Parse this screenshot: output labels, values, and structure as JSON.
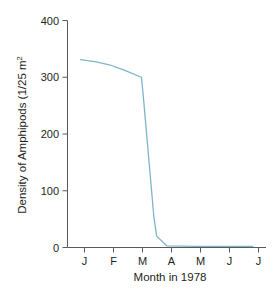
{
  "chart_data": {
    "type": "line",
    "title": "",
    "xlabel": "Month in 1978",
    "ylabel": "Density of Amphipods (1/25 m",
    "ylabel_superscript": "2",
    "x_tick_labels": [
      "J",
      "F",
      "M",
      "A",
      "M",
      "J",
      "J"
    ],
    "x_tick_months": [
      1,
      2,
      3,
      4,
      5,
      6,
      7
    ],
    "y_tick_labels": [
      "0",
      "100",
      "200",
      "300",
      "400"
    ],
    "y_ticks": [
      0,
      100,
      200,
      300,
      400
    ],
    "ylim": [
      0,
      400
    ],
    "xlim": [
      0.55,
      7.45
    ],
    "grid": false,
    "legend": false,
    "series": [
      {
        "name": "Amphipod density",
        "color": "#7FB4C6",
        "x": [
          1.0,
          1.55,
          2.0,
          2.5,
          3.12,
          3.2,
          3.55,
          3.65,
          4.0,
          5.0,
          6.0,
          7.0
        ],
        "values": [
          331,
          327,
          322,
          313,
          300,
          258,
          55,
          20,
          3,
          2,
          2,
          2
        ]
      }
    ]
  },
  "axes": {
    "line_color": "#7FB4C6",
    "axis_color": "#58595b",
    "text_color": "#231f20"
  }
}
